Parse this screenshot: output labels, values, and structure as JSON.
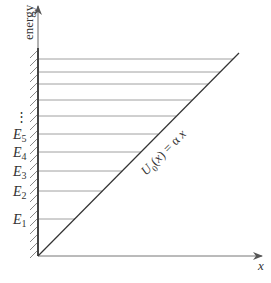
{
  "diagram": {
    "y_axis_label": "energy",
    "x_axis_label": "x",
    "potential_label": "U",
    "potential_subscript": "0",
    "potential_rest": "(x) = α x",
    "energy_levels": [
      {
        "label": "E",
        "sub": "1",
        "y": 219
      },
      {
        "label": "E",
        "sub": "2",
        "y": 191
      },
      {
        "label": "E",
        "sub": "3",
        "y": 171
      },
      {
        "label": "E",
        "sub": "4",
        "y": 152
      },
      {
        "label": "E",
        "sub": "5",
        "y": 134
      }
    ],
    "ellipsis": "⋮",
    "upper_levels_y": [
      116,
      100,
      84,
      72,
      59
    ],
    "colors": {
      "axis": "#444444",
      "levels": "#999999",
      "potential": "#333333",
      "hatch": "#777777"
    }
  }
}
